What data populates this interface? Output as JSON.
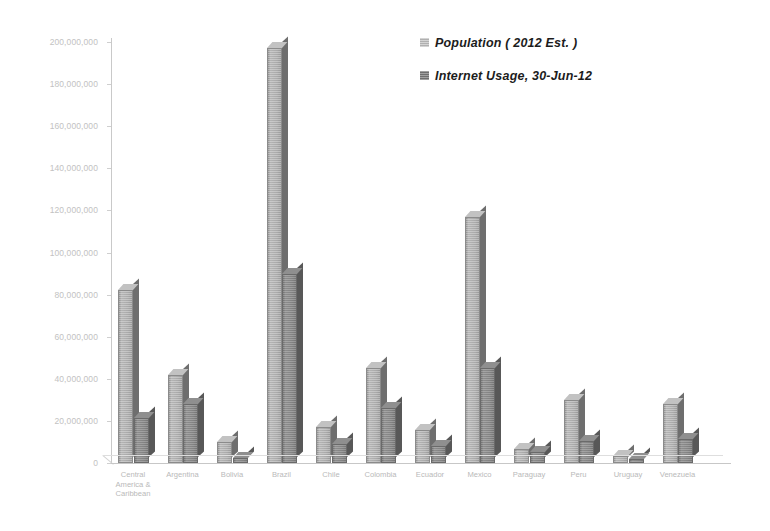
{
  "chart_data": {
    "type": "bar",
    "title": "",
    "subtitle": "",
    "xlabel": "",
    "ylabel": "",
    "ylim": [
      0,
      200000000
    ],
    "y_tick_step": 20000000,
    "grid": false,
    "legend_position": "top-right",
    "y_ticks": [
      "200,000,000",
      "180,000,000",
      "160,000,000",
      "140,000,000",
      "120,000,000",
      "100,000,000",
      "80,000,000",
      "60,000,000",
      "40,000,000",
      "20,000,000",
      "0"
    ],
    "categories": [
      "Central America & Caribbean",
      "Argentina",
      "Bolivia",
      "Brazil",
      "Chile",
      "Colombia",
      "Ecuador",
      "Mexico",
      "Paraguay",
      "Peru",
      "Uruguay",
      "Venezuela"
    ],
    "category_lines": [
      [
        "Central",
        "America &",
        "Caribbean"
      ],
      [
        "Argentina"
      ],
      [
        "Bolivia"
      ],
      [
        "Brazil"
      ],
      [
        "Chile"
      ],
      [
        "Colombia"
      ],
      [
        "Ecuador"
      ],
      [
        "Mexico"
      ],
      [
        "Paraguay"
      ],
      [
        "Peru"
      ],
      [
        "Uruguay"
      ],
      [
        "Venezuela"
      ]
    ],
    "series": [
      {
        "name": "Population ( 2012 Est. )",
        "color": "#b0b0b0",
        "values": [
          82000000,
          42000000,
          10200000,
          197000000,
          17000000,
          45000000,
          15500000,
          117000000,
          6500000,
          30000000,
          3300000,
          28000000
        ]
      },
      {
        "name": "Internet Usage, 30-Jun-12",
        "color": "#6f6f6f",
        "values": [
          21500000,
          28000000,
          2500000,
          90000000,
          9000000,
          26000000,
          8000000,
          45000000,
          5000000,
          10500000,
          2000000,
          11500000
        ]
      }
    ]
  },
  "legend": {
    "items": [
      {
        "label": "Population ( 2012 Est. )",
        "swatch": "light"
      },
      {
        "label": "Internet Usage, 30-Jun-12",
        "swatch": "dark"
      }
    ]
  }
}
